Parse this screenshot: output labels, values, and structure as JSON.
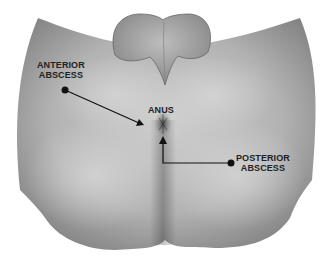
{
  "figure": {
    "type": "medical-illustration"
  },
  "labels": {
    "anterior_abscess": {
      "line1": "ANTERIOR",
      "line2": "ABSCESS"
    },
    "anus": "ANUS",
    "posterior_abscess": {
      "line1": "POSTERIOR",
      "line2": "ABSCESS"
    }
  },
  "colors": {
    "skin_light": "#c8c8c8",
    "skin_dark": "#7a7a7a",
    "label_text": "#222222",
    "pointer_line": "#111111"
  }
}
